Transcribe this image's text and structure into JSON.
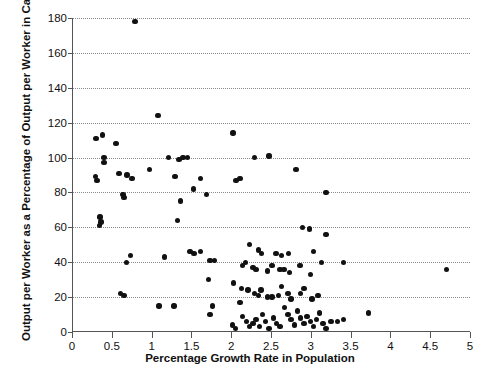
{
  "chart_data": {
    "type": "scatter",
    "title": "",
    "xlabel": "Percentage Growth Rate in Population",
    "ylabel": "Output per Worker as a Percentage of Output per Worker in Canada",
    "xlim": [
      0,
      5
    ],
    "ylim": [
      0,
      180
    ],
    "xticks": [
      0,
      0.5,
      1,
      1.5,
      2,
      2.5,
      3,
      3.5,
      4,
      4.5,
      5
    ],
    "xtick_labels": [
      "0",
      "0.5",
      "1",
      "1.5",
      "2",
      "2.5",
      "3",
      "3.5",
      "4",
      "4.5",
      "5"
    ],
    "yticks": [
      0,
      20,
      40,
      60,
      80,
      100,
      120,
      140,
      160,
      180
    ],
    "ytick_labels": [
      "0",
      "20",
      "40",
      "60",
      "80",
      "100",
      "120",
      "140",
      "160",
      "180"
    ],
    "grid": "horizontal-dotted",
    "legend": "none",
    "marker_color": "#111111",
    "axis_color": "#555555",
    "grid_color": "#8a8a8a",
    "points": [
      [
        0.78,
        178
      ],
      [
        1.07,
        124
      ],
      [
        0.29,
        111
      ],
      [
        0.37,
        113
      ],
      [
        0.54,
        108
      ],
      [
        2.01,
        114
      ],
      [
        2.8,
        93
      ],
      [
        0.39,
        100
      ],
      [
        0.39,
        97
      ],
      [
        1.2,
        100
      ],
      [
        1.33,
        99
      ],
      [
        1.38,
        100
      ],
      [
        1.44,
        100
      ],
      [
        2.28,
        100
      ],
      [
        2.46,
        101
      ],
      [
        0.58,
        91
      ],
      [
        0.68,
        90
      ],
      [
        0.74,
        88
      ],
      [
        0.28,
        89
      ],
      [
        0.3,
        87
      ],
      [
        0.96,
        93
      ],
      [
        1.28,
        89
      ],
      [
        1.6,
        88
      ],
      [
        1.68,
        79
      ],
      [
        1.51,
        82
      ],
      [
        2.05,
        87
      ],
      [
        2.1,
        88
      ],
      [
        3.18,
        80
      ],
      [
        0.63,
        79
      ],
      [
        0.64,
        77
      ],
      [
        1.35,
        75
      ],
      [
        0.34,
        66
      ],
      [
        0.35,
        63
      ],
      [
        0.33,
        61
      ],
      [
        1.31,
        64
      ],
      [
        2.88,
        60
      ],
      [
        2.97,
        59
      ],
      [
        3.18,
        56
      ],
      [
        0.72,
        44
      ],
      [
        1.52,
        45
      ],
      [
        1.6,
        46
      ],
      [
        2.22,
        50
      ],
      [
        2.33,
        47
      ],
      [
        2.37,
        45
      ],
      [
        2.55,
        45
      ],
      [
        2.62,
        44
      ],
      [
        2.71,
        45
      ],
      [
        3.02,
        46
      ],
      [
        3.12,
        40
      ],
      [
        3.4,
        40
      ],
      [
        0.67,
        40
      ],
      [
        1.15,
        43
      ],
      [
        1.47,
        46
      ],
      [
        1.72,
        41
      ],
      [
        1.78,
        41
      ],
      [
        2.13,
        38
      ],
      [
        2.17,
        40
      ],
      [
        2.26,
        37
      ],
      [
        2.3,
        36
      ],
      [
        2.44,
        35
      ],
      [
        2.5,
        38
      ],
      [
        2.6,
        36
      ],
      [
        2.65,
        36
      ],
      [
        2.72,
        34
      ],
      [
        2.85,
        38
      ],
      [
        2.98,
        33
      ],
      [
        4.69,
        36
      ],
      [
        0.6,
        22
      ],
      [
        0.64,
        21
      ],
      [
        1.7,
        30
      ],
      [
        2.02,
        28
      ],
      [
        2.12,
        25
      ],
      [
        2.2,
        24
      ],
      [
        2.28,
        22
      ],
      [
        2.33,
        21
      ],
      [
        2.36,
        24
      ],
      [
        2.44,
        20
      ],
      [
        2.5,
        20
      ],
      [
        2.58,
        21
      ],
      [
        2.62,
        26
      ],
      [
        2.7,
        22
      ],
      [
        2.74,
        19
      ],
      [
        2.86,
        22
      ],
      [
        2.9,
        25
      ],
      [
        3.0,
        19
      ],
      [
        3.08,
        21
      ],
      [
        1.08,
        15
      ],
      [
        1.27,
        15
      ],
      [
        1.75,
        15
      ],
      [
        1.72,
        10
      ],
      [
        2.0,
        4
      ],
      [
        2.04,
        2
      ],
      [
        2.1,
        17
      ],
      [
        2.13,
        9
      ],
      [
        2.18,
        6
      ],
      [
        2.22,
        3
      ],
      [
        2.26,
        5
      ],
      [
        2.3,
        7
      ],
      [
        2.34,
        3
      ],
      [
        2.38,
        10
      ],
      [
        2.42,
        6
      ],
      [
        2.46,
        2
      ],
      [
        2.52,
        8
      ],
      [
        2.56,
        5
      ],
      [
        2.6,
        3
      ],
      [
        2.66,
        14
      ],
      [
        2.7,
        10
      ],
      [
        2.74,
        7
      ],
      [
        2.78,
        4
      ],
      [
        2.82,
        12
      ],
      [
        2.86,
        8
      ],
      [
        2.9,
        5
      ],
      [
        2.94,
        9
      ],
      [
        2.98,
        6
      ],
      [
        3.02,
        3
      ],
      [
        3.06,
        7
      ],
      [
        3.1,
        11
      ],
      [
        3.14,
        5
      ],
      [
        3.18,
        2
      ],
      [
        3.24,
        6
      ],
      [
        3.32,
        6
      ],
      [
        3.4,
        7
      ],
      [
        3.71,
        11
      ]
    ]
  }
}
